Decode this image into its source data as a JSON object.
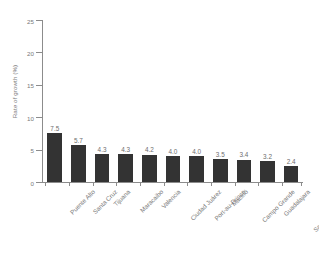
{
  "chart_data": {
    "type": "bar",
    "title": "",
    "subtitle": "",
    "xlabel": "",
    "ylabel": "Rate of growth (%)",
    "categories": [
      "Puente Alto",
      "Santa Cruz",
      "Tijuana",
      "Maracaibo",
      "Valencia",
      "Ciudad Juárez",
      "Port-au-Prince",
      "Maceió",
      "Campo Grande",
      "Guadalajara",
      "Santa Fé De Bogotá"
    ],
    "values": [
      7.5,
      5.7,
      4.3,
      4.3,
      4.2,
      4.0,
      4.0,
      3.5,
      3.4,
      3.2,
      2.4
    ],
    "value_labels": [
      "7.5",
      "5.7",
      "4.3",
      "4.3",
      "4.2",
      "4.0",
      "4.0",
      "3.5",
      "3.4",
      "3.2",
      "2.4"
    ],
    "ylim": [
      0,
      25
    ],
    "yticks": [
      0,
      5,
      10,
      15,
      20,
      25
    ],
    "ytick_labels": [
      "0",
      "5",
      "10",
      "15",
      "20",
      "25"
    ],
    "grid": false,
    "legend": null,
    "legend_position": "none",
    "bar_color": "#333333",
    "axis_color": "#8c8c8c",
    "text_color": "#7a7a7a",
    "background_color": "#ffffff"
  }
}
